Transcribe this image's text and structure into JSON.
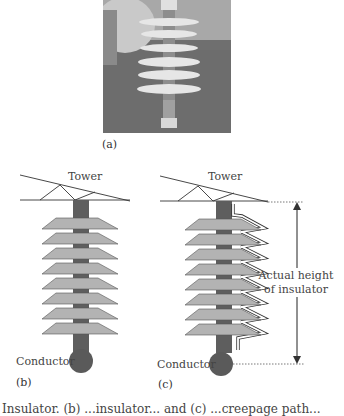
{
  "figure": {
    "panels": [
      {
        "id": "a",
        "label": "(a)",
        "content": "photo of polymer insulator held in hand outdoors"
      },
      {
        "id": "b",
        "label": "(b)",
        "tower_label": "Tower",
        "conductor_label": "Conductor",
        "sheds": 8
      },
      {
        "id": "c",
        "label": "(c)",
        "tower_label": "Tower",
        "conductor_label": "Conductor",
        "sheds": 8,
        "annotation_line1": "Actual height",
        "annotation_line2": "of insulator"
      }
    ],
    "caption_partial": "Insulator. (b) ...insulator... and (c) ...creepage path..."
  },
  "colors": {
    "shed_fill": "#b3b3b3",
    "rod_fill": "#5e5e5e",
    "conductor_fill": "#5a5a5a",
    "line": "#333333",
    "creepage": "#ffffff"
  }
}
